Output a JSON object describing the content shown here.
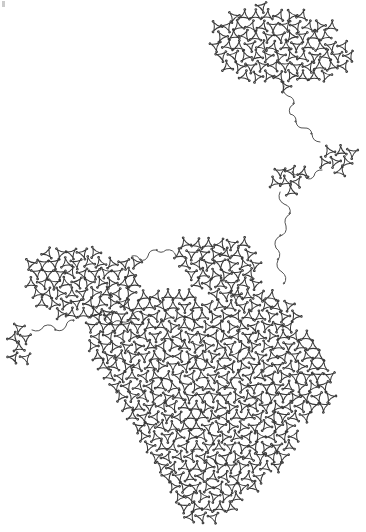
{
  "artwork": {
    "title": "Scribble Map",
    "kind": "generative-line-drawing",
    "description": "A single continuous looping pen line fills map-like landmass regions with a dense triangular-lattice of small loops, joined by sparse meandering strands across empty white space.",
    "canvas": {
      "width": 366,
      "height": 532,
      "background_color": "#ffffff"
    },
    "stroke": {
      "color": "#3a3a3a",
      "strand_color": "#4a4a4a",
      "width": 1.05,
      "strand_width": 0.95,
      "linecap": "round",
      "linejoin": "round"
    },
    "lattice": {
      "type": "triangular",
      "cell_spacing": 11.6,
      "loop_radius": 3.2,
      "lobes_per_cell": 3
    },
    "corner_mark": {
      "present": true,
      "x": 2,
      "y": 1,
      "width": 3,
      "height": 6,
      "color": "#b9b9b9"
    },
    "regions": [
      {
        "name": "north-island",
        "label": "Northern landmass",
        "polygon": [
          [
            214,
            30
          ],
          [
            222,
            17
          ],
          [
            238,
            9
          ],
          [
            262,
            6
          ],
          [
            288,
            8
          ],
          [
            308,
            14
          ],
          [
            322,
            24
          ],
          [
            330,
            18
          ],
          [
            336,
            14
          ],
          [
            340,
            20
          ],
          [
            334,
            27
          ],
          [
            338,
            38
          ],
          [
            347,
            46
          ],
          [
            350,
            58
          ],
          [
            344,
            69
          ],
          [
            330,
            76
          ],
          [
            312,
            80
          ],
          [
            296,
            82
          ],
          [
            282,
            88
          ],
          [
            272,
            84
          ],
          [
            256,
            82
          ],
          [
            238,
            76
          ],
          [
            224,
            66
          ],
          [
            214,
            52
          ],
          [
            210,
            40
          ]
        ]
      },
      {
        "name": "mid-right-patch",
        "label": "Small eastern patch",
        "polygon": [
          [
            322,
            146
          ],
          [
            333,
            142
          ],
          [
            346,
            145
          ],
          [
            354,
            154
          ],
          [
            352,
            166
          ],
          [
            342,
            173
          ],
          [
            330,
            172
          ],
          [
            321,
            164
          ],
          [
            318,
            154
          ]
        ]
      },
      {
        "name": "mid-left-patch",
        "label": "Small mid patch",
        "polygon": [
          [
            272,
            168
          ],
          [
            284,
            162
          ],
          [
            298,
            164
          ],
          [
            306,
            173
          ],
          [
            304,
            186
          ],
          [
            294,
            193
          ],
          [
            280,
            192
          ],
          [
            271,
            183
          ],
          [
            268,
            175
          ]
        ]
      },
      {
        "name": "northwest-lobe",
        "label": "Northwest lobe",
        "polygon": [
          [
            30,
            262
          ],
          [
            40,
            250
          ],
          [
            58,
            244
          ],
          [
            78,
            243
          ],
          [
            96,
            248
          ],
          [
            108,
            256
          ],
          [
            120,
            252
          ],
          [
            132,
            256
          ],
          [
            140,
            268
          ],
          [
            142,
            284
          ],
          [
            136,
            300
          ],
          [
            122,
            312
          ],
          [
            104,
            318
          ],
          [
            84,
            320
          ],
          [
            64,
            318
          ],
          [
            46,
            312
          ],
          [
            32,
            300
          ],
          [
            25,
            284
          ],
          [
            25,
            270
          ]
        ]
      },
      {
        "name": "far-west-islet",
        "label": "Far west islet",
        "polygon": [
          [
            12,
            322
          ],
          [
            22,
            318
          ],
          [
            30,
            324
          ],
          [
            32,
            340
          ],
          [
            30,
            356
          ],
          [
            22,
            364
          ],
          [
            12,
            360
          ],
          [
            8,
            346
          ],
          [
            8,
            332
          ]
        ]
      },
      {
        "name": "north-central-spur",
        "label": "North central spur",
        "polygon": [
          [
            176,
            248
          ],
          [
            190,
            238
          ],
          [
            210,
            234
          ],
          [
            232,
            236
          ],
          [
            250,
            244
          ],
          [
            260,
            256
          ],
          [
            262,
            272
          ],
          [
            256,
            286
          ],
          [
            242,
            294
          ],
          [
            224,
            296
          ],
          [
            206,
            292
          ],
          [
            190,
            284
          ],
          [
            178,
            270
          ],
          [
            174,
            258
          ]
        ]
      },
      {
        "name": "main-continent",
        "label": "Main southern continent",
        "polygon": [
          [
            86,
            318
          ],
          [
            104,
            312
          ],
          [
            124,
            306
          ],
          [
            142,
            296
          ],
          [
            156,
            288
          ],
          [
            170,
            286
          ],
          [
            184,
            292
          ],
          [
            200,
            296
          ],
          [
            216,
            298
          ],
          [
            232,
            296
          ],
          [
            248,
            292
          ],
          [
            262,
            288
          ],
          [
            276,
            290
          ],
          [
            288,
            300
          ],
          [
            296,
            314
          ],
          [
            302,
            330
          ],
          [
            312,
            342
          ],
          [
            324,
            352
          ],
          [
            332,
            366
          ],
          [
            334,
            382
          ],
          [
            330,
            398
          ],
          [
            322,
            410
          ],
          [
            312,
            418
          ],
          [
            300,
            424
          ],
          [
            296,
            438
          ],
          [
            292,
            452
          ],
          [
            284,
            464
          ],
          [
            272,
            476
          ],
          [
            258,
            488
          ],
          [
            244,
            500
          ],
          [
            230,
            512
          ],
          [
            214,
            520
          ],
          [
            198,
            522
          ],
          [
            184,
            516
          ],
          [
            172,
            504
          ],
          [
            164,
            490
          ],
          [
            158,
            474
          ],
          [
            152,
            458
          ],
          [
            144,
            444
          ],
          [
            134,
            432
          ],
          [
            124,
            420
          ],
          [
            116,
            406
          ],
          [
            110,
            392
          ],
          [
            104,
            378
          ],
          [
            98,
            364
          ],
          [
            92,
            350
          ],
          [
            86,
            336
          ]
        ]
      }
    ],
    "strands": [
      {
        "name": "strand-north-to-east",
        "from": "north-island",
        "to": "mid-right-patch",
        "points": [
          [
            284,
            86
          ],
          [
            288,
            96
          ],
          [
            294,
            104
          ],
          [
            290,
            114
          ],
          [
            296,
            122
          ],
          [
            304,
            128
          ],
          [
            312,
            134
          ],
          [
            320,
            142
          ]
        ]
      },
      {
        "name": "strand-east-to-mid",
        "from": "mid-right-patch",
        "to": "mid-left-patch",
        "points": [
          [
            322,
            170
          ],
          [
            314,
            176
          ],
          [
            306,
            178
          ],
          [
            300,
            174
          ],
          [
            292,
            172
          ]
        ]
      },
      {
        "name": "strand-mid-to-south",
        "from": "mid-left-patch",
        "to": "main-continent",
        "points": [
          [
            280,
            192
          ],
          [
            284,
            204
          ],
          [
            290,
            214
          ],
          [
            286,
            226
          ],
          [
            280,
            236
          ],
          [
            276,
            248
          ],
          [
            278,
            260
          ],
          [
            282,
            272
          ],
          [
            284,
            284
          ]
        ]
      },
      {
        "name": "strand-spur-to-northwest",
        "from": "north-central-spur",
        "to": "northwest-lobe",
        "points": [
          [
            176,
            256
          ],
          [
            166,
            250
          ],
          [
            156,
            250
          ],
          [
            148,
            256
          ],
          [
            140,
            260
          ],
          [
            132,
            256
          ]
        ]
      },
      {
        "name": "strand-islet-to-northwest",
        "from": "far-west-islet",
        "to": "northwest-lobe",
        "points": [
          [
            32,
            330
          ],
          [
            44,
            326
          ],
          [
            56,
            330
          ],
          [
            66,
            326
          ],
          [
            74,
            320
          ]
        ]
      },
      {
        "name": "strand-northwest-to-main",
        "from": "northwest-lobe",
        "to": "main-continent",
        "points": [
          [
            104,
            318
          ],
          [
            112,
            324
          ],
          [
            122,
            322
          ],
          [
            132,
            316
          ],
          [
            142,
            312
          ]
        ]
      }
    ]
  }
}
